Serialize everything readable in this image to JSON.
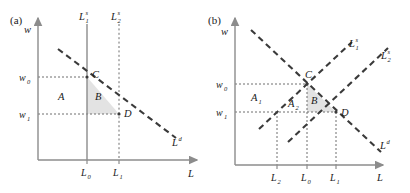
{
  "figure": {
    "panels": [
      {
        "id": "a",
        "label": "(a)",
        "axis": {
          "y_label": "w",
          "x_label": "L"
        },
        "curves": [
          {
            "name": "labour-supply-1",
            "label": "L",
            "sup": "s",
            "sub": "1",
            "style": "solid",
            "kind": "vertical"
          },
          {
            "name": "labour-supply-2",
            "label": "L",
            "sup": "s",
            "sub": "2",
            "style": "dotted",
            "kind": "vertical"
          },
          {
            "name": "labour-demand",
            "label": "L",
            "sup": "d",
            "sub": "",
            "style": "dashed",
            "kind": "downward"
          }
        ],
        "points": [
          {
            "name": "point-C",
            "label": "C",
            "x": 87,
            "y": 77
          },
          {
            "name": "point-D",
            "label": "D",
            "x": 119,
            "y": 114
          }
        ],
        "y_ticks": [
          {
            "label": "w",
            "sub": "0",
            "value": 77
          },
          {
            "label": "w",
            "sub": "1",
            "value": 114
          }
        ],
        "x_ticks": [
          {
            "label": "L",
            "sub": "0",
            "value": 87
          },
          {
            "label": "L",
            "sub": "1",
            "value": 119
          }
        ],
        "regions": [
          {
            "name": "region-A",
            "label": "A",
            "sub": "",
            "fill": "#ffffff"
          },
          {
            "name": "region-B",
            "label": "B",
            "sub": "",
            "fill": "#e3e3e3"
          }
        ]
      },
      {
        "id": "b",
        "label": "(b)",
        "axis": {
          "y_label": "w",
          "x_label": "L"
        },
        "curves": [
          {
            "name": "labour-supply-1",
            "label": "L",
            "sup": "s",
            "sub": "1",
            "style": "dashed",
            "kind": "upward"
          },
          {
            "name": "labour-supply-2",
            "label": "L",
            "sup": "s",
            "sub": "2",
            "style": "dashed",
            "kind": "upward"
          },
          {
            "name": "labour-demand",
            "label": "L",
            "sup": "d",
            "sub": "",
            "style": "dashed",
            "kind": "downward"
          }
        ],
        "points": [
          {
            "name": "point-C",
            "label": "C",
            "x": 307,
            "y": 84
          },
          {
            "name": "point-D",
            "label": "D",
            "x": 336,
            "y": 112
          }
        ],
        "y_ticks": [
          {
            "label": "w",
            "sub": "0",
            "value": 84
          },
          {
            "label": "w",
            "sub": "1",
            "value": 112
          }
        ],
        "x_ticks": [
          {
            "label": "L",
            "sub": "2",
            "value": 277
          },
          {
            "label": "L",
            "sub": "0",
            "value": 307
          },
          {
            "label": "L",
            "sub": "1",
            "value": 336
          }
        ],
        "regions": [
          {
            "name": "region-A1",
            "label": "A",
            "sub": "1",
            "fill": "#ffffff"
          },
          {
            "name": "region-A2",
            "label": "A",
            "sub": "2",
            "fill": "#ffffff"
          },
          {
            "name": "region-B",
            "label": "B",
            "sub": "",
            "fill": "#e3e3e3"
          }
        ]
      }
    ],
    "colors": {
      "axis": "#8c8c8c",
      "curve": "#3a3a3a",
      "guide": "#6e6e6e",
      "shade": "#e3e3e3",
      "text": "#1a1a1a"
    }
  }
}
